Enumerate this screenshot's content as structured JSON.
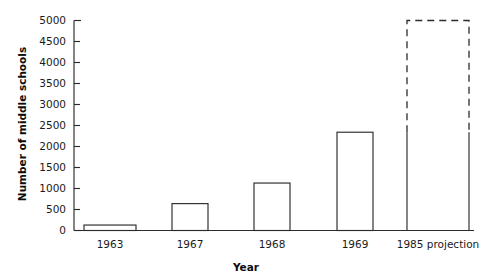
{
  "chart_data": {
    "type": "bar",
    "title": "",
    "subtitle": "",
    "xlabel": "Year",
    "ylabel": "Number of middle schools",
    "categories": [
      "1963",
      "1967",
      "1968",
      "1969",
      "1985 projection"
    ],
    "values": [
      130,
      640,
      1130,
      2340,
      5000
    ],
    "series": [
      {
        "name": "Number of middle schools",
        "values": [
          130,
          640,
          1130,
          2340,
          5000
        ]
      }
    ],
    "ylim": [
      0,
      5000
    ],
    "ytick_labels": [
      "0",
      "500",
      "1000",
      "1500",
      "2000",
      "2500",
      "3000",
      "3500",
      "4000",
      "4500",
      "5000"
    ],
    "ytick_values": [
      0,
      500,
      1000,
      1500,
      2000,
      2500,
      3000,
      3500,
      4000,
      4500,
      5000
    ],
    "grid": false,
    "legend": "none",
    "bar_style": {
      "fill": "#ffffff",
      "stroke": "#2b2b2b",
      "projection_linestyle": "dashed"
    },
    "notes": [
      "Last bar (1985 projection) is drawn with dashed outline above the actual-data level and is wider than the other bars."
    ]
  },
  "axis": {
    "y_title": "Number of middle schools",
    "x_title": "Year"
  },
  "colors": {
    "background": "#ffffff",
    "ink": "#2b2b2b",
    "text": "#1a1a1a"
  }
}
